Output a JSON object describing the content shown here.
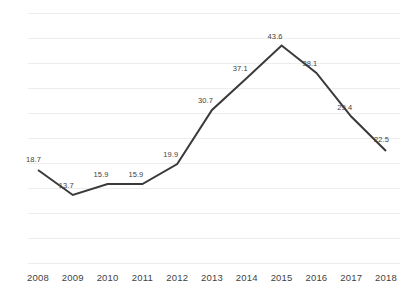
{
  "chart_data": {
    "type": "line",
    "title": "",
    "xlabel": "",
    "ylabel": "",
    "categories": [
      "2008",
      "2009",
      "2010",
      "2011",
      "2012",
      "2013",
      "2014",
      "2015",
      "2016",
      "2017",
      "2018"
    ],
    "values": [
      18.7,
      13.7,
      15.9,
      15.9,
      19.9,
      30.7,
      37.1,
      43.6,
      38.1,
      29.4,
      22.5
    ],
    "data_labels": [
      "18.7",
      "13.7",
      "15.9",
      "15.9",
      "19.9",
      "30.7",
      "37.1",
      "43.6",
      "38.1",
      "29.4",
      "22.5"
    ],
    "series": [
      {
        "name": "",
        "values": [
          18.7,
          13.7,
          15.9,
          15.9,
          19.9,
          30.7,
          37.1,
          43.6,
          38.1,
          29.4,
          22.5
        ],
        "color": "#3a3a3a"
      }
    ],
    "ylim": [
      0,
      50
    ],
    "ytick_values": [
      0,
      5,
      10,
      15,
      20,
      25,
      30,
      35,
      40,
      45,
      50
    ],
    "ytick_labels_visible": false,
    "grid": {
      "horizontal": true,
      "vertical": false,
      "color": "#ededed",
      "count": 10
    },
    "legend": {
      "visible": false,
      "position": "none"
    },
    "markers": false,
    "line_color": "#3a3a3a",
    "line_width": 2,
    "label_color": "#3f3f3f",
    "background": "#ffffff"
  }
}
